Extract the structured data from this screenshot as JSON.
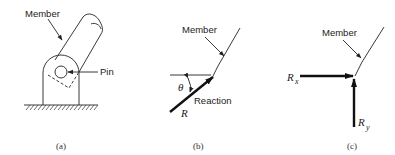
{
  "figure": {
    "panels": [
      {
        "id": "a",
        "caption": "(a)",
        "labels": {
          "member": "Member",
          "pin": "Pin"
        },
        "description": "Member attached to ground support by a pin"
      },
      {
        "id": "b",
        "caption": "(b)",
        "labels": {
          "member": "Member",
          "reaction": "Reaction",
          "force": "R",
          "angle": "θ"
        },
        "description": "Reaction force R at angle theta from horizontal"
      },
      {
        "id": "c",
        "caption": "(c)",
        "labels": {
          "member": "Member",
          "rx": "R",
          "rx_sub": "x",
          "ry": "R",
          "ry_sub": "y"
        },
        "description": "Reaction resolved into components Rx and Ry"
      }
    ]
  }
}
